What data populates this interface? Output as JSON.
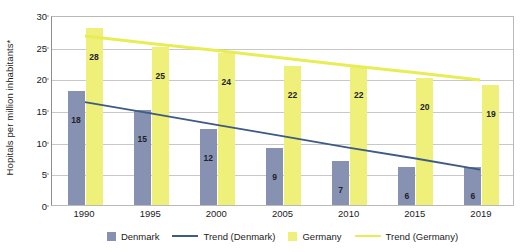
{
  "chart_data": {
    "type": "bar",
    "title": "",
    "subtitle": "",
    "xlabel": "",
    "ylabel": "Hopitals per million inhabitants*",
    "ylim": [
      0,
      30
    ],
    "yticks": [
      0,
      5,
      10,
      15,
      20,
      25,
      30
    ],
    "grid": true,
    "legend_position": "bottom",
    "categories": [
      "1990",
      "1995",
      "2000",
      "2005",
      "2010",
      "2015",
      "2019"
    ],
    "series": [
      {
        "name": "Denmark",
        "kind": "bar",
        "color": "#8792b3",
        "values": [
          18,
          15,
          12,
          9,
          7,
          6,
          6
        ]
      },
      {
        "name": "Germany",
        "kind": "bar",
        "color": "#eef07a",
        "values": [
          28,
          25,
          24,
          22,
          22,
          20,
          19
        ]
      },
      {
        "name": "Trend (Denmark)",
        "kind": "line",
        "color": "#3d5b85",
        "values": [
          16.5,
          14.7,
          12.9,
          11.1,
          9.3,
          7.6,
          5.8
        ]
      },
      {
        "name": "Trend (Germany)",
        "kind": "line",
        "color": "#e8ec55",
        "values": [
          27.0,
          25.8,
          24.7,
          23.5,
          22.3,
          21.2,
          20.0
        ]
      }
    ],
    "legend": [
      {
        "label": "Denmark",
        "marker": "box",
        "color": "#8792b3"
      },
      {
        "label": "Trend (Denmark)",
        "marker": "line",
        "color": "#3d5b85"
      },
      {
        "label": "Germany",
        "marker": "box",
        "color": "#eef07a"
      },
      {
        "label": "Trend (Germany)",
        "marker": "line",
        "color": "#e8ec55"
      }
    ]
  }
}
